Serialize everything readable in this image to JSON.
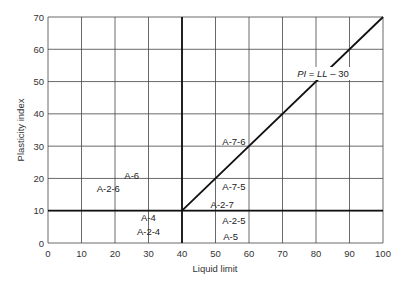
{
  "chart_data": {
    "type": "line",
    "title": "",
    "xlabel": "Liquid limit",
    "ylabel": "Plasticity index",
    "xlim": [
      0,
      100
    ],
    "ylim": [
      0,
      70
    ],
    "xticks": [
      0,
      10,
      20,
      30,
      40,
      50,
      60,
      70,
      80,
      90,
      100
    ],
    "yticks": [
      0,
      10,
      20,
      30,
      40,
      50,
      60,
      70
    ],
    "grid": true,
    "legend": null,
    "series": [
      {
        "name": "PI = LL − 30",
        "x": [
          40,
          100
        ],
        "y": [
          10,
          70
        ],
        "style": "bold"
      },
      {
        "name": "PI = 10 boundary",
        "x": [
          0,
          100
        ],
        "y": [
          10,
          10
        ],
        "style": "bold"
      },
      {
        "name": "LL = 40 boundary",
        "x": [
          40,
          40
        ],
        "y": [
          0,
          70
        ],
        "style": "bold"
      }
    ],
    "annotations": [
      {
        "text": "PI = LL − 30",
        "x": 83,
        "y": 51.5,
        "italic_vars": true
      },
      {
        "text": "A-6",
        "x": 25,
        "y": 21
      },
      {
        "text": "A-2-6",
        "x": 18,
        "y": 17
      },
      {
        "text": "A-4",
        "x": 30,
        "y": 8
      },
      {
        "text": "A-2-4",
        "x": 30,
        "y": 3.5
      },
      {
        "text": "A-7-6",
        "x": 55.5,
        "y": 31.5
      },
      {
        "text": "A-7-5",
        "x": 55.5,
        "y": 17.5
      },
      {
        "text": "A-2-7",
        "x": 52,
        "y": 12
      },
      {
        "text": "A-2-5",
        "x": 55.5,
        "y": 7
      },
      {
        "text": "A-5",
        "x": 54.5,
        "y": 2
      }
    ]
  },
  "labels": {
    "xlabel": "Liquid limit",
    "ylabel": "Plasticity index",
    "eq_pi": "PI",
    "eq_eq": " = ",
    "eq_ll": "LL",
    "eq_rest": " – 30"
  }
}
